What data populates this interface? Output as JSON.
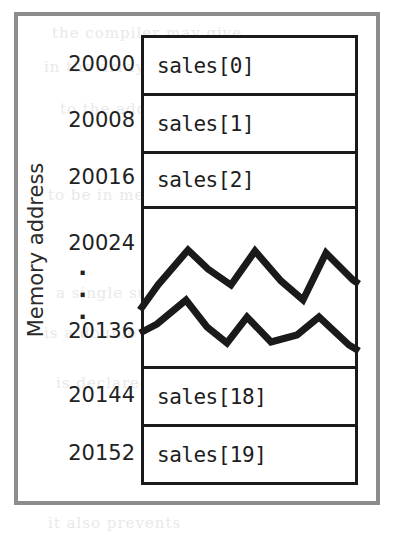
{
  "figure": {
    "axis_label": "Memory address",
    "ellipsis": "·",
    "ellipsis_count": 3
  },
  "colors": {
    "outer_frame": "#8c8c8c",
    "table_border": "#1a1a1a",
    "divider": "#1a1a1a",
    "text": "#222222",
    "background": "#ffffff"
  },
  "memory_map": {
    "rows": [
      {
        "address": "20000",
        "cell": "sales[0]",
        "kind": "cell"
      },
      {
        "address": "20008",
        "cell": "sales[1]",
        "kind": "cell"
      },
      {
        "address": "20016",
        "cell": "sales[2]",
        "kind": "cell"
      },
      {
        "address": "20024",
        "cell": "",
        "kind": "break-top"
      },
      {
        "address": "20136",
        "cell": "",
        "kind": "break-bottom"
      },
      {
        "address": "20144",
        "cell": "sales[18]",
        "kind": "cell"
      },
      {
        "address": "20152",
        "cell": "sales[19]",
        "kind": "cell"
      }
    ]
  },
  "bleed_text": {
    "lines": [
      "the compiler may give",
      "in the array and the",
      "to the address of",
      "to be in memory at",
      "a single subscript and",
      "is a double that",
      "is declared as",
      "it also prevents"
    ]
  }
}
